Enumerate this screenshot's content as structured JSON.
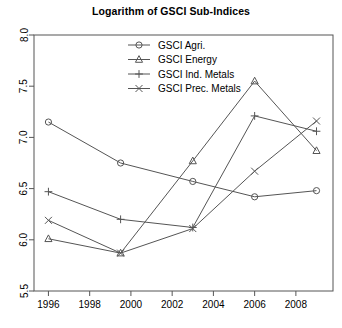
{
  "chart_data": {
    "type": "line",
    "title": "Logarithm of GSCI Sub-Indices",
    "xlabel": "",
    "ylabel": "",
    "xlim": [
      1995.3,
      2009.8
    ],
    "ylim": [
      5.5,
      8.0
    ],
    "xticks": [
      1996,
      1998,
      2000,
      2002,
      2004,
      2006,
      2008
    ],
    "xtick_labels": [
      "1996",
      "1998",
      "2000",
      "2002",
      "2004",
      "2006",
      "2008"
    ],
    "yticks": [
      5.5,
      6.0,
      6.5,
      7.0,
      7.5,
      8.0
    ],
    "ytick_labels": [
      "5.5",
      "6.0",
      "6.5",
      "7.0",
      "7.5",
      "8.0"
    ],
    "grid": false,
    "legend_position": "top-center",
    "x": [
      1996,
      1999.5,
      2003,
      2006,
      2009
    ],
    "series": [
      {
        "name": "GSCI Agri.",
        "marker": "circle",
        "color": "#555555",
        "values": [
          7.15,
          6.75,
          6.57,
          6.42,
          6.48
        ]
      },
      {
        "name": "GSCI Energy",
        "marker": "triangle",
        "color": "#555555",
        "values": [
          6.01,
          5.87,
          6.77,
          7.55,
          6.87
        ]
      },
      {
        "name": "GSCI Ind. Metals",
        "marker": "plus",
        "color": "#555555",
        "values": [
          6.47,
          6.2,
          6.12,
          7.21,
          7.06
        ]
      },
      {
        "name": "GSCI Prec. Metals",
        "marker": "cross",
        "color": "#555555",
        "values": [
          6.19,
          5.87,
          6.11,
          6.67,
          7.16
        ]
      }
    ]
  },
  "legend": {
    "entries": [
      {
        "label": "GSCI Agri."
      },
      {
        "label": "GSCI Energy"
      },
      {
        "label": "GSCI Ind. Metals"
      },
      {
        "label": "GSCI Prec. Metals"
      }
    ]
  },
  "colors": {
    "axis": "#555555",
    "line": "#555555",
    "text": "#000000",
    "background": "#ffffff"
  }
}
